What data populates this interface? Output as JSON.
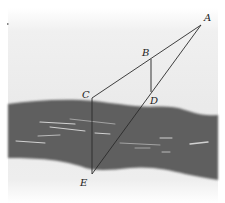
{
  "diagram": {
    "type": "geometry-figure",
    "colors": {
      "background": "#ececec",
      "river": "#5e5e5e",
      "lines": "#2a2a2a",
      "highlights": "#e8e8e8"
    },
    "points": [
      {
        "id": "A",
        "label": "A",
        "x": 201,
        "y": 25,
        "lx": 205,
        "ly": 20
      },
      {
        "id": "B",
        "label": "B",
        "x": 151,
        "y": 59,
        "lx": 143,
        "ly": 56
      },
      {
        "id": "C",
        "label": "C",
        "x": 92,
        "y": 98,
        "lx": 83,
        "ly": 98
      },
      {
        "id": "D",
        "label": "D",
        "x": 151,
        "y": 92,
        "lx": 151,
        "ly": 104
      },
      {
        "id": "E",
        "label": "E",
        "x": 92,
        "y": 174,
        "lx": 81,
        "ly": 186
      }
    ],
    "segments": [
      {
        "from": "A",
        "to": "C"
      },
      {
        "from": "A",
        "to": "E"
      },
      {
        "from": "B",
        "to": "D"
      },
      {
        "from": "C",
        "to": "E"
      }
    ],
    "labels": {
      "A": "A",
      "B": "B",
      "C": "C",
      "D": "D",
      "E": "E"
    }
  }
}
